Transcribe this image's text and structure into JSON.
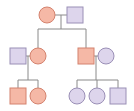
{
  "diagram": {
    "type": "pedigree-chart",
    "colors": {
      "affected_fill": "#f5b8a6",
      "affected_stroke": "#d4826e",
      "unaffected_fill": "#ddd5ec",
      "unaffected_stroke": "#9a8fb6",
      "line": "#8a8a8a",
      "background": "#ffffff"
    },
    "legend": {
      "circle": "female",
      "square": "male",
      "salmon": "affected",
      "lavender": "unaffected"
    },
    "generations": [
      {
        "label": "I",
        "individuals": [
          {
            "id": "I-1",
            "sex": "female",
            "status": "affected",
            "cx": 47,
            "cy": 15
          },
          {
            "id": "I-2",
            "sex": "male",
            "status": "unaffected",
            "cx": 75,
            "cy": 15
          }
        ]
      },
      {
        "label": "II",
        "individuals": [
          {
            "id": "II-1",
            "sex": "male",
            "status": "unaffected",
            "cx": 18,
            "cy": 56,
            "spouse_of": "II-2"
          },
          {
            "id": "II-2",
            "sex": "female",
            "status": "affected",
            "cx": 38,
            "cy": 56,
            "parents": [
              "I-1",
              "I-2"
            ]
          },
          {
            "id": "II-3",
            "sex": "male",
            "status": "affected",
            "cx": 86,
            "cy": 56,
            "parents": [
              "I-1",
              "I-2"
            ]
          },
          {
            "id": "II-4",
            "sex": "female",
            "status": "unaffected",
            "cx": 106,
            "cy": 56,
            "spouse_of": "II-3"
          }
        ]
      },
      {
        "label": "III",
        "individuals": [
          {
            "id": "III-1",
            "sex": "male",
            "status": "affected",
            "cx": 18,
            "cy": 96,
            "parents": [
              "II-1",
              "II-2"
            ]
          },
          {
            "id": "III-2",
            "sex": "female",
            "status": "affected",
            "cx": 38,
            "cy": 96,
            "parents": [
              "II-1",
              "II-2"
            ]
          },
          {
            "id": "III-3",
            "sex": "female",
            "status": "unaffected",
            "cx": 77,
            "cy": 96,
            "parents": [
              "II-3",
              "II-4"
            ]
          },
          {
            "id": "III-4",
            "sex": "female",
            "status": "unaffected",
            "cx": 97,
            "cy": 96,
            "parents": [
              "II-3",
              "II-4"
            ]
          },
          {
            "id": "III-5",
            "sex": "male",
            "status": "unaffected",
            "cx": 118,
            "cy": 96,
            "parents": [
              "II-3",
              "II-4"
            ]
          }
        ]
      }
    ]
  }
}
